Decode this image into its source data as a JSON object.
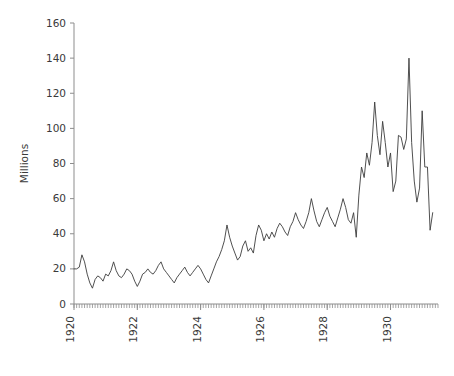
{
  "chart_data": {
    "type": "line",
    "title": "",
    "subtitle": "",
    "xlabel": "",
    "ylabel": "Millions",
    "ylim": [
      0,
      160
    ],
    "ytick_step": 20,
    "yticks": [
      0,
      20,
      40,
      60,
      80,
      100,
      120,
      140,
      160
    ],
    "ytick_labels": [
      "0",
      "20",
      "40",
      "60",
      "80",
      "100",
      "120",
      "140",
      "160"
    ],
    "xlim": [
      1920.0,
      1931.5
    ],
    "xticks": [
      1920,
      1922,
      1924,
      1926,
      1928,
      1930
    ],
    "xtick_labels": [
      "1920",
      "1922",
      "1924",
      "1926",
      "1928",
      "1930"
    ],
    "xtick_label_rotation": -90,
    "x_minor_tick_interval": 0.08333,
    "grid": false,
    "legend": false,
    "legend_position": "none",
    "line_color": "#3c3c3c",
    "axis_color": "#8d8d8d",
    "text_color": "#3a3a3a",
    "background_color": "#ffffff",
    "x_unit": "year (monthly observations)",
    "series": [
      {
        "name": "Millions",
        "x": [
          1920.0,
          1920.083,
          1920.167,
          1920.25,
          1920.333,
          1920.417,
          1920.5,
          1920.583,
          1920.667,
          1920.75,
          1920.833,
          1920.917,
          1921.0,
          1921.083,
          1921.167,
          1921.25,
          1921.333,
          1921.417,
          1921.5,
          1921.583,
          1921.667,
          1921.75,
          1921.833,
          1921.917,
          1922.0,
          1922.083,
          1922.167,
          1922.25,
          1922.333,
          1922.417,
          1922.5,
          1922.583,
          1922.667,
          1922.75,
          1922.833,
          1922.917,
          1923.0,
          1923.083,
          1923.167,
          1923.25,
          1923.333,
          1923.417,
          1923.5,
          1923.583,
          1923.667,
          1923.75,
          1923.833,
          1923.917,
          1924.0,
          1924.083,
          1924.167,
          1924.25,
          1924.333,
          1924.417,
          1924.5,
          1924.583,
          1924.667,
          1924.75,
          1924.833,
          1924.917,
          1925.0,
          1925.083,
          1925.167,
          1925.25,
          1925.333,
          1925.417,
          1925.5,
          1925.583,
          1925.667,
          1925.75,
          1925.833,
          1925.917,
          1926.0,
          1926.083,
          1926.167,
          1926.25,
          1926.333,
          1926.417,
          1926.5,
          1926.583,
          1926.667,
          1926.75,
          1926.833,
          1926.917,
          1927.0,
          1927.083,
          1927.167,
          1927.25,
          1927.333,
          1927.417,
          1927.5,
          1927.583,
          1927.667,
          1927.75,
          1927.833,
          1927.917,
          1928.0,
          1928.083,
          1928.167,
          1928.25,
          1928.333,
          1928.417,
          1928.5,
          1928.583,
          1928.667,
          1928.75,
          1928.833,
          1928.917,
          1929.0,
          1929.083,
          1929.167,
          1929.25,
          1929.333,
          1929.417,
          1929.5,
          1929.583,
          1929.667,
          1929.75,
          1929.833,
          1929.917,
          1930.0,
          1930.083,
          1930.167,
          1930.25,
          1930.333,
          1930.417,
          1930.5,
          1930.583,
          1930.667,
          1930.75,
          1930.833,
          1930.917,
          1931.0,
          1931.083,
          1931.167,
          1931.25,
          1931.333
        ],
        "values": [
          20,
          20,
          21,
          28,
          24,
          17,
          12,
          9,
          14,
          16,
          15,
          13,
          17,
          16,
          19,
          24,
          19,
          16,
          15,
          17,
          20,
          19,
          17,
          13,
          10,
          13,
          17,
          18,
          20,
          18,
          17,
          19,
          22,
          24,
          20,
          18,
          16,
          14,
          12,
          15,
          17,
          19,
          21,
          18,
          16,
          18,
          20,
          22,
          20,
          17,
          14,
          12,
          16,
          20,
          24,
          27,
          31,
          36,
          45,
          38,
          33,
          29,
          25,
          27,
          33,
          36,
          30,
          32,
          29,
          39,
          45,
          42,
          36,
          40,
          37,
          41,
          38,
          43,
          46,
          44,
          41,
          39,
          44,
          47,
          52,
          48,
          45,
          43,
          47,
          52,
          60,
          53,
          47,
          44,
          48,
          52,
          55,
          50,
          47,
          44,
          49,
          54,
          60,
          55,
          48,
          46,
          52,
          38,
          62,
          78,
          72,
          86,
          79,
          92,
          115,
          96,
          85,
          104,
          92,
          78,
          86,
          64,
          70,
          96,
          95,
          88,
          94,
          140,
          92,
          70,
          58,
          66,
          110,
          78,
          78,
          42,
          52
        ]
      }
    ]
  }
}
